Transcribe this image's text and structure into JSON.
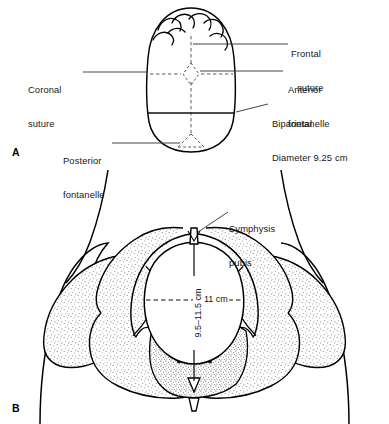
{
  "figure": {
    "panels": [
      {
        "letter": "A",
        "name": "fetal-skull-vertex-view",
        "labels": [
          {
            "key": "coronal-suture",
            "text": "Coronal\nsuture"
          },
          {
            "key": "frontal-suture",
            "text": "Frontal\nsuture"
          },
          {
            "key": "anterior-fontanelle",
            "text": "Anterior\nfontanelle"
          },
          {
            "key": "biparietal-diameter",
            "text": "Biparietal\nDiameter 9.25 cm"
          },
          {
            "key": "posterior-fontanelle",
            "text": "Posterior\nfontanelle"
          }
        ],
        "measurements": [
          {
            "key": "biparietal",
            "label": "Biparietal Diameter",
            "value": "9.25",
            "unit": "cm"
          }
        ]
      },
      {
        "letter": "B",
        "name": "pelvic-inlet-anterior-view",
        "labels": [
          {
            "key": "symphysis-pubis",
            "text": "Symphysis\npubis"
          }
        ],
        "measurements": [
          {
            "key": "transverse-diameter",
            "label": "Transverse diameter",
            "value": "11 cm",
            "unit": "cm"
          },
          {
            "key": "anteroposterior-diameter",
            "label": "Anteroposterior diameter",
            "value": "9.5–11.5 cm",
            "unit": "cm"
          }
        ]
      }
    ],
    "label_texts": {
      "coronal_suture_l1": "Coronal",
      "coronal_suture_l2": "suture",
      "frontal_suture_l1": "Frontal",
      "frontal_suture_l2": "suture",
      "anterior_fontanelle_l1": "Anterior",
      "anterior_fontanelle_l2": "fontanelle",
      "biparietal_l1": "Biparietal",
      "biparietal_l2": "Diameter 9.25 cm",
      "posterior_fontanelle_l1": "Posterior",
      "posterior_fontanelle_l2": "fontanelle",
      "symphysis_pubis_l1": "Symphysis",
      "symphysis_pubis_l2": "pubis",
      "inlet_transverse": "11 cm",
      "inlet_ap": "9.5–11.5 cm",
      "panel_a": "A",
      "panel_b": "B"
    },
    "colors": {
      "ink": "#111111",
      "outline": "#000000",
      "leader": "#333333",
      "suture_dash": "#555555",
      "stipple": "#2a2a2a",
      "background": "#ffffff"
    }
  }
}
